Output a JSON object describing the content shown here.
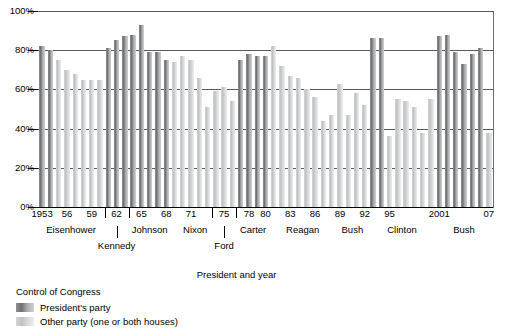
{
  "chart_data": {
    "type": "bar",
    "title": "",
    "xlabel": "President and year",
    "ylabel": "",
    "ylim": [
      0,
      100
    ],
    "grid": true,
    "legend_position": "below-left",
    "y_ticks": [
      "0%",
      "20%",
      "40%",
      "60%",
      "80%",
      "100%"
    ],
    "y_tick_values": [
      0,
      20,
      40,
      60,
      80,
      100
    ],
    "x_tick_labels": [
      "1953",
      "56",
      "59",
      "62",
      "65",
      "68",
      "71",
      "75",
      "78",
      "80",
      "83",
      "86",
      "89",
      "92",
      "95",
      "2001",
      "07"
    ],
    "x_tick_years": [
      1953,
      1956,
      1959,
      1962,
      1965,
      1968,
      1971,
      1975,
      1978,
      1980,
      1983,
      1986,
      1989,
      1992,
      1995,
      2001,
      2007
    ],
    "categories": [
      1953,
      1954,
      1955,
      1956,
      1957,
      1958,
      1959,
      1960,
      1961,
      1962,
      1963,
      1964,
      1965,
      1966,
      1967,
      1968,
      1969,
      1970,
      1971,
      1972,
      1973,
      1974,
      1975,
      1976,
      1977,
      1978,
      1979,
      1980,
      1981,
      1982,
      1983,
      1984,
      1985,
      1986,
      1987,
      1988,
      1989,
      1990,
      1991,
      1992,
      1993,
      1994,
      1995,
      1996,
      1997,
      1998,
      1999,
      2000,
      2001,
      2002,
      2003,
      2004,
      2005,
      2006,
      2007
    ],
    "series": [
      {
        "name": "Percent of presidential victories on congressional votes",
        "values": [
          82,
          80,
          75,
          70,
          68,
          65,
          65,
          65,
          81,
          85,
          87,
          88,
          93,
          79,
          79,
          75,
          74,
          77,
          75,
          66,
          51,
          59,
          61,
          54,
          75,
          78,
          77,
          77,
          82,
          72,
          67,
          66,
          60,
          56,
          44,
          47,
          63,
          47,
          58,
          52,
          86,
          86,
          36,
          55,
          54,
          51,
          38,
          55,
          87,
          88,
          79,
          73,
          78,
          81,
          38
        ]
      }
    ],
    "bar_party": [
      "dark",
      "dark",
      "light",
      "light",
      "light",
      "light",
      "light",
      "light",
      "dark",
      "dark",
      "dark",
      "dark",
      "dark",
      "dark",
      "dark",
      "dark",
      "light",
      "light",
      "light",
      "light",
      "light",
      "light",
      "light",
      "light",
      "dark",
      "dark",
      "dark",
      "dark",
      "light",
      "light",
      "light",
      "light",
      "light",
      "light",
      "light",
      "light",
      "light",
      "light",
      "light",
      "light",
      "dark",
      "dark",
      "light",
      "light",
      "light",
      "light",
      "light",
      "light",
      "dark",
      "dark",
      "dark",
      "dark",
      "dark",
      "dark",
      "light"
    ],
    "presidents": [
      {
        "name": "Eisenhower",
        "start": 1953,
        "end": 1960
      },
      {
        "name": "Kennedy",
        "start": 1961,
        "end": 1963
      },
      {
        "name": "Johnson",
        "start": 1964,
        "end": 1968
      },
      {
        "name": "Nixon",
        "start": 1969,
        "end": 1974
      },
      {
        "name": "Ford",
        "start": 1974,
        "end": 1976
      },
      {
        "name": "Carter",
        "start": 1977,
        "end": 1980
      },
      {
        "name": "Reagan",
        "start": 1981,
        "end": 1988
      },
      {
        "name": "Bush",
        "start": 1989,
        "end": 1992
      },
      {
        "name": "Clinton",
        "start": 1993,
        "end": 2000
      },
      {
        "name": "Bush",
        "start": 2001,
        "end": 2007
      }
    ],
    "bracketed_ticks": [
      "62",
      "75"
    ],
    "legend": {
      "title": "Control of Congress",
      "entries": [
        {
          "label": "President's party",
          "swatch": "dark"
        },
        {
          "label": "Other party (one or both houses)",
          "swatch": "light"
        }
      ]
    },
    "colors": {
      "dark_bar": "#6e7073",
      "light_bar": "#bfc1c3",
      "gridline": "#58595b",
      "axis": "#000000"
    }
  },
  "axis_title_text": "President and year"
}
